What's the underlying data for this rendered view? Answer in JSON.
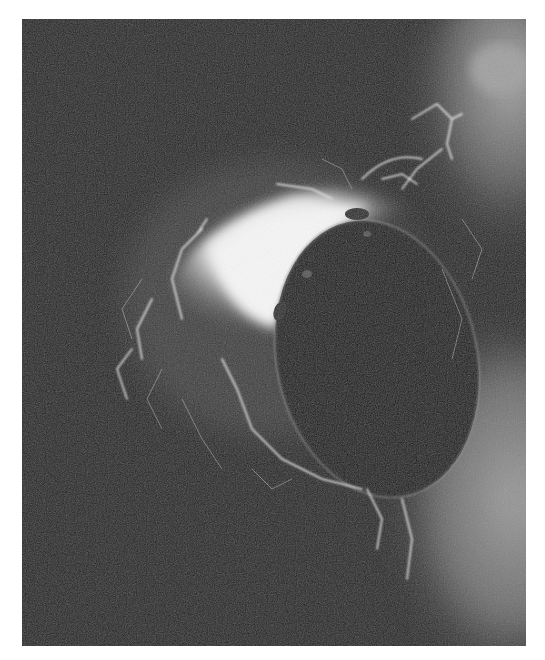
{
  "image": {
    "kind": "grayscale medical scan (angiographic-style)",
    "background_color": "#1f1f1f",
    "page_background": "#ffffff",
    "regions": [
      {
        "name": "bright-vascular-mass",
        "color": "#f4f4f4"
      },
      {
        "name": "dark-oval-cavity",
        "color": "#141414"
      },
      {
        "name": "gray-tissue-lower-right",
        "color": "#8a8a8a"
      },
      {
        "name": "gray-tissue-upper-right",
        "color": "#9a9a9a"
      }
    ]
  }
}
